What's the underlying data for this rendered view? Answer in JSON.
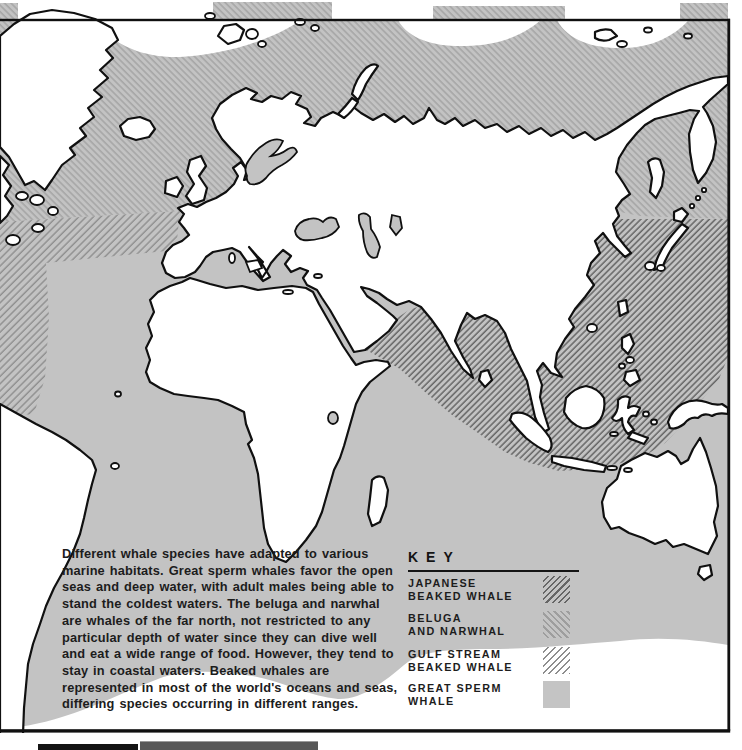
{
  "page": {
    "type": "whale-species-distribution-map",
    "description_paragraph": "Different whale species have adapted to various marine habitats. Great sperm whales favor the open seas and deep water, with adult males being able to stand the coldest waters. The beluga and narwhal are whales of the far north, not restricted to any particular depth of water since they can dive well and eat a wide range of food. However, they tend to stay in coastal waters. Beaked whales are represented in most of the world's oceans and seas, differing species occurring in different ranges.",
    "key": {
      "title": "KEY",
      "entries": [
        {
          "line1": "JAPANESE",
          "line2": "BEAKED WHALE",
          "pattern": "forward-diagonal-dark-on-gray"
        },
        {
          "line1": "BELUGA",
          "line2": "AND NARWHAL",
          "pattern": "back-diagonal-light-on-gray"
        },
        {
          "line1": "GULF STREAM",
          "line2": "BEAKED WHALE",
          "pattern": "forward-diagonal-on-white"
        },
        {
          "line1": "GREAT SPERM",
          "line2": "WHALE",
          "pattern": "solid-gray"
        }
      ]
    },
    "colors": {
      "ocean_gray": "#c3c3c3",
      "land": "#ffffff",
      "coastline": "#101010",
      "text": "#1c1c1c",
      "hatch_japanese": "#666666",
      "hatch_beluga": "#a4a4a4",
      "hatch_gulf_stream": "#8e8e8e"
    }
  }
}
